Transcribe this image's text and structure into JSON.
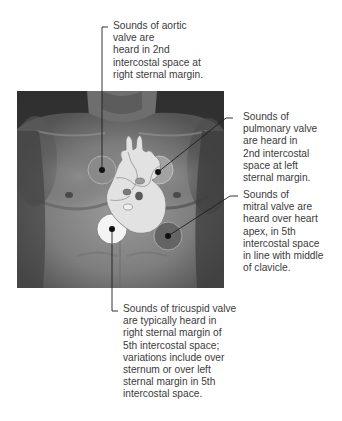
{
  "figure": {
    "colors": {
      "skin_dark": "#3c3c3c",
      "skin_mid": "#7a7a7a",
      "heart_fill": "#dcdcdc",
      "zone_aortic": "#8a8a8a",
      "zone_pulmonary": "#9a9a9a",
      "zone_mitral": "#6a6a6a",
      "zone_tricuspid": "#f4f4f4",
      "leader_line": "#1a1a1a"
    }
  },
  "labels": {
    "aortic": {
      "lines": [
        "Sounds of aortic",
        "valve are",
        "heard in 2nd",
        "intercostal space at",
        "right sternal margin."
      ]
    },
    "pulmonary": {
      "lines": [
        "Sounds of",
        "pulmonary valve",
        "are heard in",
        "2nd intercostal",
        "space at left",
        "sternal margin."
      ]
    },
    "mitral": {
      "lines": [
        "Sounds of",
        "mitral valve are",
        "heard over heart",
        "apex, in 5th",
        "intercostal space",
        "in line with middle",
        "of clavicle."
      ]
    },
    "tricuspid": {
      "lines": [
        "Sounds of tricuspid valve",
        "are typically heard in",
        "right sternal margin of",
        "5th intercostal space;",
        "variations include over",
        "sternum or over left",
        "sternal margin in 5th",
        "intercostal space."
      ]
    }
  }
}
